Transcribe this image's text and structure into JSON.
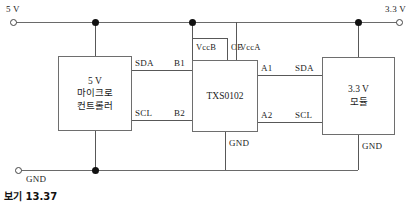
{
  "figure": {
    "caption": "보기 13.37"
  },
  "rails": {
    "vcc5_label": "5 V",
    "vcc33_label": "3.3 V",
    "gnd_label": "GND"
  },
  "blocks": {
    "mcu": {
      "line1": "5 V",
      "line2": "마이크로",
      "line3": "컨트롤러"
    },
    "level_shifter": {
      "line1": "TXS0102"
    },
    "module": {
      "line1": "3.3 V",
      "line2": "모듈"
    }
  },
  "pins": {
    "mcu_sda": "SDA",
    "mcu_scl": "SCL",
    "shifter_b1": "B1",
    "shifter_b2": "B2",
    "shifter_a1": "A1",
    "shifter_a2": "A2",
    "shifter_vccb": "VccB",
    "shifter_oe": "OE",
    "shifter_vcca": "VccA",
    "shifter_gnd": "GND",
    "module_sda": "SDA",
    "module_scl": "SCL",
    "module_gnd": "GND"
  }
}
